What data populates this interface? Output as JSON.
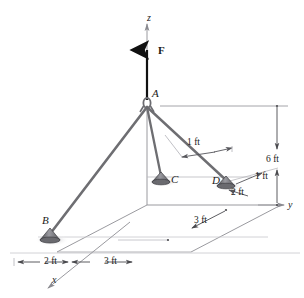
{
  "figure": {
    "type": "engineering-free-body-diagram",
    "units": "ft"
  },
  "colors": {
    "cord": "#6e6e72",
    "cord_dark": "#55555a",
    "construction": "#a9a9ae",
    "dimension": "#4a4a4e",
    "force": "#111111",
    "axis": "#9a9a9f",
    "anchor_body": "#8a8a8f",
    "anchor_dark": "#3c3c40",
    "shadow": "#c9c9ce",
    "text": "#1a1a1a",
    "background": "#ffffff"
  },
  "axes": [
    {
      "name": "z-axis",
      "label": "z",
      "x": 150,
      "y": 18
    },
    {
      "name": "y-axis",
      "label": "y",
      "x": 288,
      "y": 205
    },
    {
      "name": "x-axis",
      "label": "x",
      "x": 56,
      "y": 281
    }
  ],
  "force": {
    "name": "applied-force-F",
    "label": "F",
    "x": 160,
    "y": 51,
    "direction": "up",
    "applied_at": "A"
  },
  "points": [
    {
      "id": "A",
      "label": "A",
      "lx": 153,
      "ly": 93,
      "px": 147,
      "py": 105,
      "kind": "hook-ring"
    },
    {
      "id": "B",
      "label": "B",
      "lx": 44,
      "ly": 220,
      "px": 50,
      "py": 235,
      "kind": "anchor-base"
    },
    {
      "id": "C",
      "label": "C",
      "lx": 172,
      "ly": 179,
      "px": 160,
      "py": 178,
      "kind": "anchor-base"
    },
    {
      "id": "D",
      "label": "D",
      "lx": 214,
      "ly": 181,
      "px": 226,
      "py": 182,
      "kind": "anchor-base"
    }
  ],
  "cords": [
    {
      "name": "cord-AB",
      "from": "A",
      "to": "B"
    },
    {
      "name": "cord-AC",
      "from": "A",
      "to": "C"
    },
    {
      "name": "cord-AD",
      "from": "A",
      "to": "D"
    }
  ],
  "dimensions": [
    {
      "name": "dim-1ft-upper",
      "label": "1 ft",
      "x": 196,
      "y": 143,
      "arrows": "double"
    },
    {
      "name": "dim-1ft-at-D",
      "label": "1 ft",
      "x": 258,
      "y": 178,
      "arrows": "single"
    },
    {
      "name": "dim-2ft-at-D",
      "label": "2 ft",
      "x": 234,
      "y": 192,
      "arrows": "single"
    },
    {
      "name": "dim-6ft-height",
      "label": "6 ft",
      "x": 272,
      "y": 160,
      "arrows": "double"
    },
    {
      "name": "dim-3ft-depth",
      "label": "3 ft",
      "x": 199,
      "y": 222,
      "arrows": "double"
    },
    {
      "name": "dim-2ft-base",
      "label": "2 ft",
      "x": 30,
      "y": 265,
      "arrows": "double"
    },
    {
      "name": "dim-3ft-base",
      "label": "3 ft",
      "x": 100,
      "y": 265,
      "arrows": "double"
    }
  ]
}
